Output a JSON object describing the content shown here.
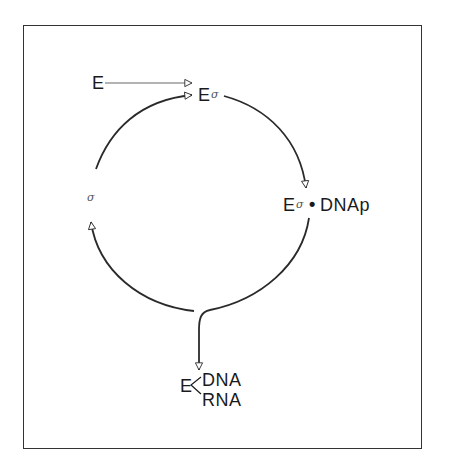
{
  "diagram": {
    "type": "cycle",
    "nodes": {
      "core_enzyme": {
        "label": "E"
      },
      "holoenzyme": {
        "label_e": "E",
        "label_sigma": "σ"
      },
      "promoter_complex": {
        "label_e": "E",
        "label_sigma": "σ",
        "label_dot": "•",
        "label_dnap": "DNAp"
      },
      "elongation_complex": {
        "label_e": "E",
        "label_dna": "DNA",
        "label_rna": "RNA",
        "bracket": "<"
      },
      "free_sigma": {
        "label": "σ"
      }
    },
    "edges": [
      {
        "from": "core_enzyme",
        "to": "holoenzyme",
        "style": "thin-arrow"
      },
      {
        "from": "free_sigma",
        "to": "holoenzyme",
        "style": "arc-arrow"
      },
      {
        "from": "holoenzyme",
        "to": "promoter_complex",
        "style": "arc-arrow"
      },
      {
        "from": "promoter_complex",
        "to": "elongation_complex",
        "style": "arc-branch-arrow"
      },
      {
        "from": "promoter_complex",
        "to": "free_sigma",
        "style": "arc-arrow"
      }
    ],
    "colors": {
      "line": "#2a2a2a",
      "frame": "#333333",
      "text": "#1a1a1a",
      "sigma": "#555555"
    }
  }
}
